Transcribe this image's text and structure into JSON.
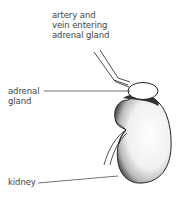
{
  "diagram": {
    "labels": {
      "vessels": "artery and\nvein entering\nadrenal gland",
      "adrenal": "adrenal\ngland",
      "kidney": "kidney"
    },
    "colors": {
      "ink": "#222222",
      "label_text": "#444444",
      "background": "#ffffff"
    }
  }
}
